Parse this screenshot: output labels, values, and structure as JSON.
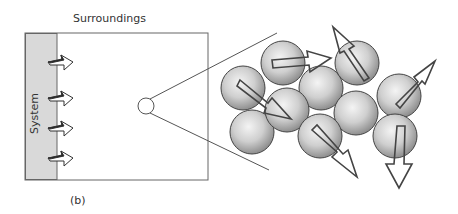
{
  "figure": {
    "labels": {
      "surroundings": "Surroundings",
      "system": "System",
      "panel": "(b)"
    },
    "colors": {
      "stroke": "#555555",
      "system_fill": "#d8d8d8",
      "sphere_light": "#f2f2f2",
      "sphere_dark": "#9a9a9a",
      "arrow_fill": "#ffffff"
    },
    "container_box": {
      "x": 25,
      "y": 33,
      "width": 183,
      "height": 147
    },
    "system_band": {
      "x": 25,
      "y": 33,
      "width": 32,
      "height": 147
    },
    "wall_arrows_count": 4,
    "magnifier": {
      "cx": 146,
      "cy": 106,
      "r": 8
    },
    "molecules_count": 10
  }
}
